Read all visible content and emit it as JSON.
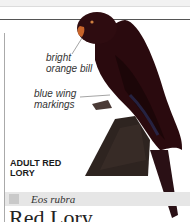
{
  "annotations": [
    {
      "line1": "bright",
      "line2": "orange bill"
    },
    {
      "line1": "blue wing",
      "line2": "markings"
    }
  ],
  "caption": {
    "line1": "ADULT RED",
    "line2": "LORY"
  },
  "species": {
    "scientific_name": "Eos rubra"
  },
  "title": "Red Lory",
  "colors": {
    "bird_body": "#2a0a0e",
    "bill": "#c8642a",
    "perch": "#2e2420",
    "species_band": "#e6e6e6"
  }
}
